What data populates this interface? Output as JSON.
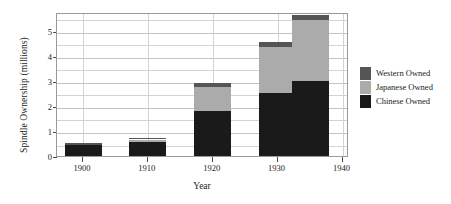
{
  "chart_data": {
    "type": "bar",
    "stacked": true,
    "title": "",
    "xlabel": "Year",
    "ylabel": "Spindle Ownership (millions)",
    "x": [
      1900,
      1910,
      1920,
      1930,
      1935
    ],
    "categories": [
      "1900",
      "1910",
      "1920",
      "1930",
      "1935"
    ],
    "series": [
      {
        "name": "Chinese Owned",
        "color": "#1a1a1a",
        "values": [
          0.45,
          0.58,
          1.8,
          2.5,
          3.0
        ]
      },
      {
        "name": "Japanese Owned",
        "color": "#ababab",
        "values": [
          0.0,
          0.08,
          0.95,
          1.85,
          2.45
        ]
      },
      {
        "name": "Western Owned",
        "color": "#555555",
        "values": [
          0.07,
          0.07,
          0.15,
          0.2,
          0.2
        ]
      }
    ],
    "totals": [
      0.52,
      0.73,
      2.9,
      4.55,
      5.65
    ],
    "xlim": [
      1896,
      1941
    ],
    "ylim": [
      0,
      5.75
    ],
    "ytick_values": [
      0,
      1,
      2,
      3,
      4,
      5
    ],
    "ytick_labels": [
      "0",
      "1",
      "2",
      "3",
      "4",
      "5"
    ],
    "yminor_values": [
      0.5,
      1.5,
      2.5,
      3.5,
      4.5,
      5.5
    ],
    "xtick_values": [
      1900,
      1910,
      1920,
      1930,
      1940
    ],
    "xtick_labels": [
      "1900",
      "1910",
      "1920",
      "1930",
      "1940"
    ],
    "grid": true,
    "legend_position": "right"
  },
  "legend": {
    "entries": [
      {
        "label": "Western Owned",
        "color": "#555555"
      },
      {
        "label": "Japanese Owned",
        "color": "#ababab"
      },
      {
        "label": "Chinese Owned",
        "color": "#1a1a1a"
      }
    ]
  }
}
